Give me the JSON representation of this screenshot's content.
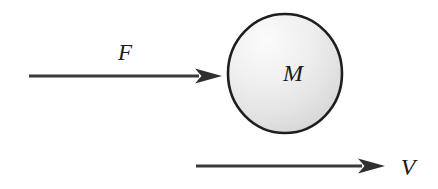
{
  "figure": {
    "type": "free-body-diagram",
    "background_color": "#ffffff",
    "stroke_color": "#3a3a3a",
    "outline_color": "#1e1e1e",
    "label_color": "#1c1c1c",
    "body_fill_light": "#f4f4f4",
    "body_fill_dark": "#d4d4d4"
  },
  "labels": {
    "force": "F",
    "mass": "M",
    "velocity": "V"
  },
  "elements": {
    "force_arrow": {
      "name": "force-arrow",
      "label": "F",
      "direction": "right",
      "x_start": 29,
      "x_end": 222,
      "y": 76
    },
    "mass_body": {
      "name": "mass-circle",
      "label": "M",
      "center_x": 285,
      "center_y": 73.5,
      "radius_x": 58,
      "radius_y": 60.5
    },
    "velocity_arrow": {
      "name": "velocity-arrow",
      "label": "V",
      "direction": "right",
      "x_start": 196,
      "x_end": 385,
      "y": 166
    }
  }
}
